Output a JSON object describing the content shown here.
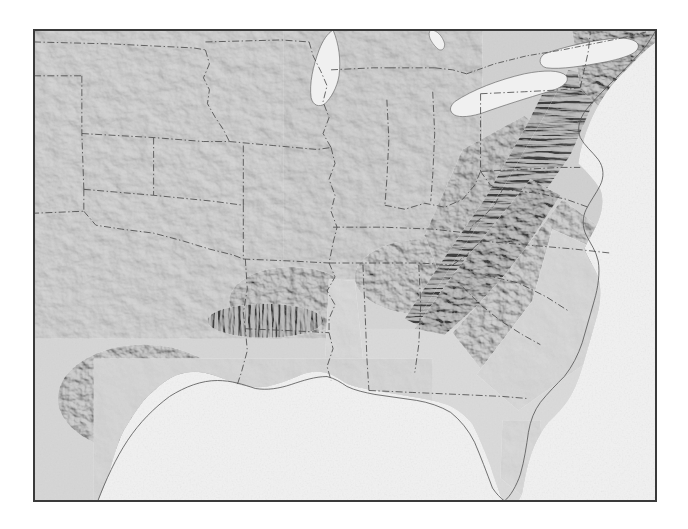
{
  "figure": {
    "kind": "shaded-relief-map",
    "title": "",
    "region": "Central and Eastern United States",
    "frame": {
      "x": 33,
      "y": 29,
      "width": 624,
      "height": 473,
      "border_color": "#3a3a3a",
      "border_width_px": 1.5
    },
    "background_color": "#ffffff",
    "projection_hint": "conic",
    "has_labels": false,
    "has_legend": false,
    "has_scalebar": false,
    "has_graticule": false
  },
  "palette": {
    "ocean": "#f2f2f2",
    "land_base": "#d2d2d2",
    "land_light": "#e4e4e4",
    "land_dark": "#9a9a9a",
    "relief_shadow": "#6e6e6e",
    "boundary_line": "#454545",
    "coastline": "#5a5a5a",
    "frame": "#3a3a3a"
  },
  "map_layers": [
    {
      "name": "ocean",
      "style": "flat-fill",
      "color": "#f2f2f2"
    },
    {
      "name": "landmass",
      "style": "flat-fill",
      "color": "#d2d2d2"
    },
    {
      "name": "hillshade",
      "style": "grayscale-relief",
      "illumination_azimuth_deg": 315
    },
    {
      "name": "state-boundaries",
      "style": "dash-dot",
      "color": "#454545"
    },
    {
      "name": "coastline",
      "style": "solid-thin",
      "color": "#5a5a5a"
    },
    {
      "name": "lakes",
      "style": "flat-fill",
      "color": "#f0f0f0"
    }
  ],
  "water_bodies": [
    {
      "name": "Lake Michigan",
      "type": "lake"
    },
    {
      "name": "Lake Erie",
      "type": "lake"
    },
    {
      "name": "Lake Ontario",
      "type": "lake"
    },
    {
      "name": "Lake Huron",
      "type": "lake"
    },
    {
      "name": "Gulf of Mexico",
      "type": "sea"
    },
    {
      "name": "Atlantic Ocean",
      "type": "ocean"
    }
  ],
  "terrain_features": [
    {
      "name": "Appalachian Ridge and Valley",
      "intensity": "high"
    },
    {
      "name": "Blue Ridge Mountains",
      "intensity": "high"
    },
    {
      "name": "Ouachita Mountains",
      "intensity": "medium"
    },
    {
      "name": "Ozark Plateau",
      "intensity": "medium"
    },
    {
      "name": "Edwards Plateau",
      "intensity": "medium"
    },
    {
      "name": "Great Plains",
      "intensity": "low"
    },
    {
      "name": "Mississippi Alluvial Plain",
      "intensity": "low"
    },
    {
      "name": "Atlantic Coastal Plain",
      "intensity": "low"
    },
    {
      "name": "Florida Peninsula",
      "intensity": "low"
    }
  ]
}
